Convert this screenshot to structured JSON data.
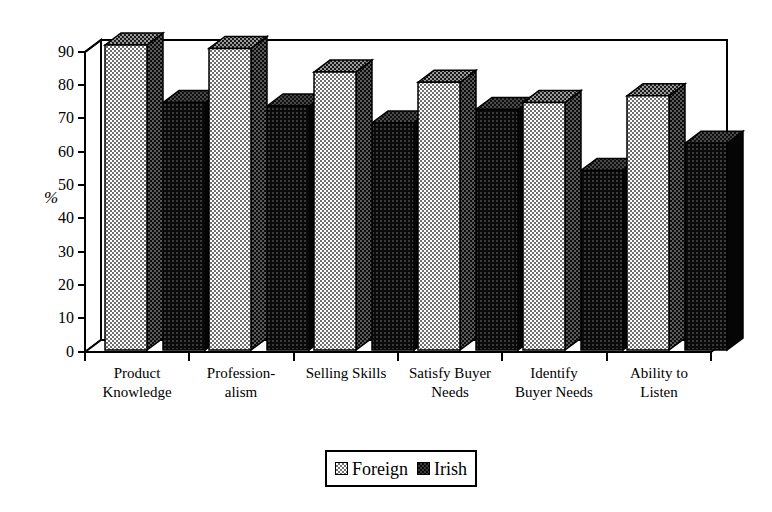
{
  "chart_data": {
    "type": "bar",
    "title": "",
    "subtitle": "",
    "xlabel": "",
    "ylabel": "%",
    "ylim": [
      0,
      90
    ],
    "ytick_step": 10,
    "yticks": [
      "0",
      "10",
      "20",
      "30",
      "40",
      "50",
      "60",
      "70",
      "80",
      "90"
    ],
    "grid": false,
    "style": "3d-clustered-column",
    "legend_position": "bottom-center",
    "categories": [
      "Product Knowledge",
      "Profession- alism",
      "Selling Skills",
      "Satisfy Buyer Needs",
      "Identify Buyer Needs",
      "Ability to Listen"
    ],
    "categories_wrapped": [
      [
        "Product",
        "Knowledge"
      ],
      [
        "Profession-",
        "alism"
      ],
      [
        "Selling Skills",
        ""
      ],
      [
        "Satisfy Buyer",
        "Needs"
      ],
      [
        "Identify",
        "Buyer Needs"
      ],
      [
        "Ability to",
        "Listen"
      ]
    ],
    "series": [
      {
        "name": "Foreign",
        "color": "#a8a8a8",
        "values": [
          90,
          89,
          82,
          79,
          73,
          75
        ]
      },
      {
        "name": "Irish",
        "color": "#1a1a1a",
        "values": [
          73,
          72,
          67,
          71,
          53,
          61
        ]
      }
    ]
  },
  "legend": {
    "items": [
      {
        "label": "Foreign",
        "swatch": "foreign-swatch"
      },
      {
        "label": "Irish",
        "swatch": "irish-swatch"
      }
    ]
  },
  "axis": {
    "y_label": "%",
    "ticks": [
      "90",
      "80",
      "70",
      "60",
      "50",
      "40",
      "30",
      "20",
      "10",
      "0"
    ]
  }
}
